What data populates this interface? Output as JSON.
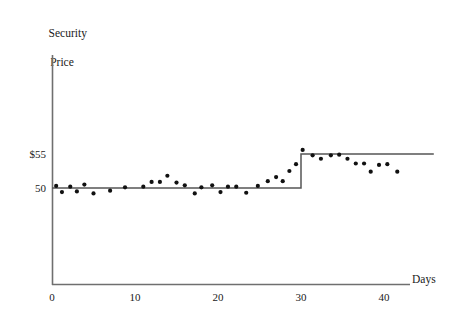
{
  "chart_data": {
    "type": "scatter",
    "title": "",
    "ylabel_line1": "Security",
    "ylabel_line2": "Price",
    "xlabel": "Days",
    "xlim": [
      0,
      46
    ],
    "ylim": [
      43.5,
      62
    ],
    "xticks": [
      0,
      10,
      20,
      30,
      40
    ],
    "xtick_labels": [
      "0",
      "10",
      "20",
      "30",
      "40"
    ],
    "yticks": [
      50,
      55
    ],
    "ytick_labels": [
      "50",
      "$55"
    ],
    "grid": false,
    "legend": null,
    "series": [
      {
        "name": "Observed security price",
        "type": "scatter",
        "marker": "dot",
        "color": "#111111",
        "points": [
          [
            0.5,
            50.3
          ],
          [
            1.2,
            49.4
          ],
          [
            2.2,
            50.2
          ],
          [
            3.0,
            49.5
          ],
          [
            3.9,
            50.5
          ],
          [
            5.0,
            49.2
          ],
          [
            7.0,
            49.6
          ],
          [
            8.8,
            50.1
          ],
          [
            11.0,
            50.2
          ],
          [
            12.0,
            50.9
          ],
          [
            13.0,
            50.9
          ],
          [
            13.9,
            51.8
          ],
          [
            15.0,
            50.8
          ],
          [
            16.0,
            50.4
          ],
          [
            17.2,
            49.2
          ],
          [
            18.0,
            50.1
          ],
          [
            19.3,
            50.4
          ],
          [
            20.3,
            49.4
          ],
          [
            21.2,
            50.2
          ],
          [
            22.2,
            50.2
          ],
          [
            23.4,
            49.3
          ],
          [
            24.8,
            50.3
          ],
          [
            26.0,
            51.0
          ],
          [
            27.0,
            51.6
          ],
          [
            27.8,
            51.0
          ],
          [
            28.6,
            52.5
          ],
          [
            29.4,
            53.5
          ],
          [
            30.2,
            55.6
          ],
          [
            31.4,
            54.8
          ],
          [
            32.4,
            54.3
          ],
          [
            33.6,
            54.8
          ],
          [
            34.6,
            54.9
          ],
          [
            35.6,
            54.3
          ],
          [
            36.6,
            53.6
          ],
          [
            37.6,
            53.6
          ],
          [
            38.4,
            52.4
          ],
          [
            39.4,
            53.4
          ],
          [
            40.4,
            53.5
          ],
          [
            41.6,
            52.4
          ]
        ]
      },
      {
        "name": "Expected / fundamental value (step)",
        "type": "step",
        "color": "#555555",
        "points": [
          [
            0,
            50
          ],
          [
            30,
            50
          ],
          [
            30,
            55
          ],
          [
            46,
            55
          ]
        ]
      }
    ]
  },
  "axes": {
    "y_axis_name": "security-price-axis",
    "x_axis_name": "days-axis"
  }
}
